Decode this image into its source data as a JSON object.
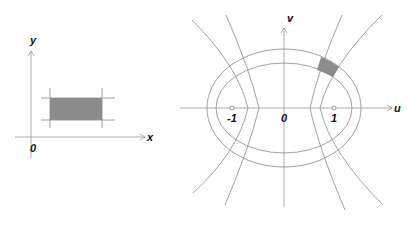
{
  "left_panel": {
    "x_label": "x",
    "y_label": "y",
    "origin_label": "0",
    "region": "rectangle",
    "fill_color": "#8c8c8c"
  },
  "right_panel": {
    "u_label": "u",
    "v_label": "v",
    "origin_label": "0",
    "focus_left_label": "-1",
    "focus_right_label": "1",
    "curves": [
      "outer-ellipse",
      "inner-ellipse",
      "left-hyperbola-branches",
      "right-hyperbola-branches"
    ],
    "fill_color": "#8c8c8c"
  }
}
